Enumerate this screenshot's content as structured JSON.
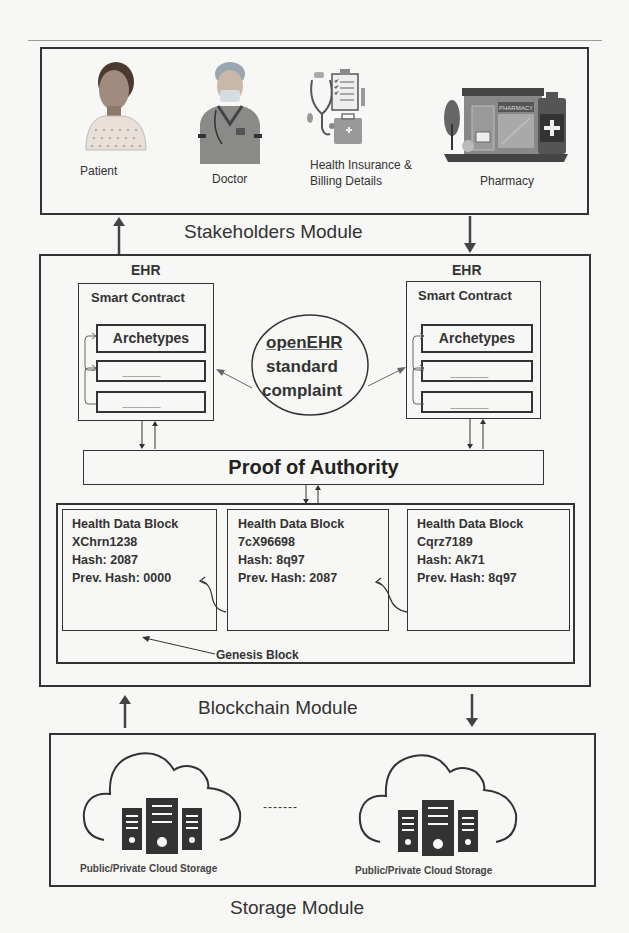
{
  "stakeholders_module": {
    "title": "Stakeholders Module",
    "items": [
      {
        "label": "Patient",
        "icon": "patient-icon"
      },
      {
        "label": "Doctor",
        "icon": "doctor-icon"
      },
      {
        "label_line1": "Health Insurance &",
        "label_line2": "Billing Details",
        "icon": "insurance-billing-icon"
      },
      {
        "label": "Pharmacy",
        "icon": "pharmacy-icon"
      }
    ]
  },
  "blockchain_module": {
    "title": "Blockchain Module",
    "ehr_left": {
      "heading": "EHR",
      "smart_contract": "Smart Contract",
      "archetypes": "Archetypes",
      "placeholder_rows": [
        "...............................",
        "..............................."
      ]
    },
    "ehr_right": {
      "heading": "EHR",
      "smart_contract": "Smart Contract",
      "archetypes": "Archetypes",
      "placeholder_rows": [
        "...............................",
        "..............................."
      ]
    },
    "standard_circle": {
      "line1": "openEHR",
      "line2": "standard",
      "line3": "complaint"
    },
    "consensus": "Proof of Authority",
    "blocks": [
      {
        "title": "Health Data Block",
        "id": "XChrn1238",
        "hash": "Hash: 2087",
        "prev_hash": "Prev. Hash: 0000"
      },
      {
        "title": "Health Data Block",
        "id": "7cX96698",
        "hash": "Hash: 8q97",
        "prev_hash": "Prev. Hash: 2087"
      },
      {
        "title": "Health Data Block",
        "id": "Cqrz7189",
        "hash": "Hash: Ak71",
        "prev_hash": "Prev. Hash: 8q97"
      }
    ],
    "genesis_label": "Genesis Block"
  },
  "storage_module": {
    "title": "Storage Module",
    "clouds": [
      {
        "label": "Public/Private Cloud Storage",
        "icon": "cloud-server-icon"
      },
      {
        "label": "Public/Private Cloud Storage",
        "icon": "cloud-server-icon"
      }
    ],
    "separator": "-------"
  },
  "colors": {
    "line": "#333333",
    "background": "#f7f7f5"
  }
}
